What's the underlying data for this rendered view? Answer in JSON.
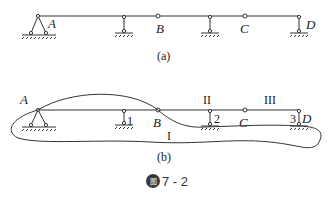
{
  "figure": {
    "caption_badge": "图",
    "caption_number": "7 - 2",
    "subfigures": [
      {
        "label": "(a)",
        "points": [
          "A",
          "B",
          "C",
          "D"
        ],
        "description": "Multi-span beam with hinges at B and C; fixed-pin support at A, link supports at intermediate points and D"
      },
      {
        "label": "(b)",
        "points": [
          "A",
          "B",
          "C",
          "D"
        ],
        "support_numbers": [
          "1",
          "2",
          "3"
        ],
        "regions": [
          "I",
          "II",
          "III"
        ],
        "description": "Same beam with closed contour enclosing region I; regions II and III marked above beam"
      }
    ]
  },
  "labels": {
    "a": {
      "A": "A",
      "B": "B",
      "C": "C",
      "D": "D",
      "caption": "(a)"
    },
    "b": {
      "A": "A",
      "B": "B",
      "C": "C",
      "D": "D",
      "n1": "1",
      "n2": "2",
      "n3": "3",
      "r1": "I",
      "r2": "II",
      "r3": "III",
      "caption": "(b)"
    }
  },
  "colors": {
    "line": "#333333",
    "badge": "#3a3a3a"
  }
}
